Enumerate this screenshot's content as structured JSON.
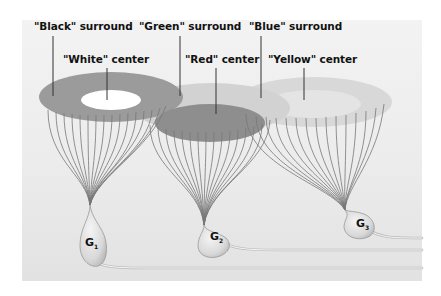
{
  "figure": {
    "labels": {
      "black_surround": "\"Black\" surround",
      "green_surround": "\"Green\" surround",
      "blue_surround": "\"Blue\" surround",
      "white_center": "\"White\" center",
      "red_center": "\"Red\" center",
      "yellow_center": "\"Yellow\" center"
    },
    "cells": [
      {
        "name": "G",
        "subscript": "1"
      },
      {
        "name": "G",
        "subscript": "2"
      },
      {
        "name": "G",
        "subscript": "3"
      }
    ],
    "colors": {
      "panel": "#ececec",
      "black_surround": "#9a9a9a",
      "white_center": "#ffffff",
      "green_surround": "#d3d3d3",
      "red_center": "#8f8f8f",
      "blue_surround": "#d8d8d8",
      "yellow_center": "#e6e6e6",
      "fibers": "#6f6f6f"
    }
  }
}
